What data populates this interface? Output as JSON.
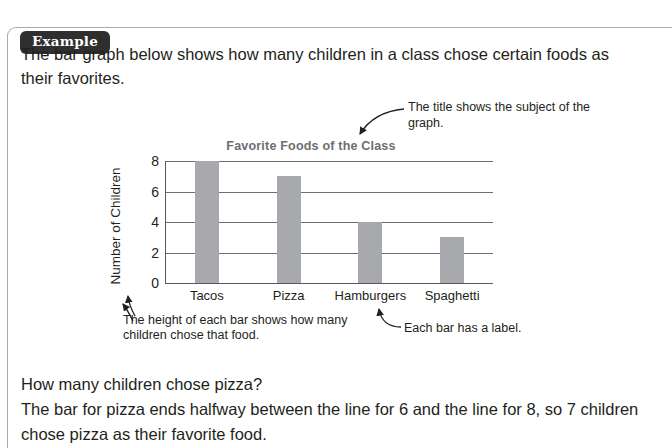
{
  "box": {
    "badge_label": "Example"
  },
  "intro": {
    "text": "The bar graph below shows how many children in a class chose certain foods as their favorites."
  },
  "annotations": {
    "title_callout": "The title shows the subject of the graph.",
    "height_callout": "The height of each bar shows how many children chose that food.",
    "label_callout": "Each bar has a label."
  },
  "answer": {
    "question": "How many children chose pizza?",
    "explanation": "The bar for pizza ends halfway between the line for 6 and the line for 8, so 7 children chose pizza as their favorite food."
  },
  "colors": {
    "bar_fill": "#a7a9ac",
    "axis": "#58595b",
    "gridline": "#6d6e71",
    "title": "#6d6e71",
    "badge_bg": "#2f2f2f",
    "frame": "#a7a9ac",
    "text": "#231f20"
  },
  "chart_data": {
    "type": "bar",
    "title": "Favorite Foods of the Class",
    "xlabel": "",
    "ylabel": "Number of Children",
    "categories": [
      "Tacos",
      "Pizza",
      "Hamburgers",
      "Spaghetti"
    ],
    "values": [
      8,
      7,
      4,
      3
    ],
    "ylim": [
      0,
      8
    ],
    "yticks": [
      0,
      2,
      4,
      6,
      8
    ],
    "ytick_labels": [
      "0",
      "2",
      "4",
      "6",
      "8"
    ],
    "grid": true,
    "legend": "none"
  }
}
